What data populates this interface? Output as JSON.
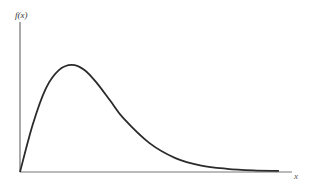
{
  "chart_data": {
    "type": "line",
    "title": "",
    "xlabel": "x",
    "ylabel": "f(x)",
    "grid": false,
    "legend": null,
    "series": [
      {
        "name": "f(x)",
        "x": [
          0,
          0.5,
          1,
          1.5,
          2,
          2.5,
          3,
          3.5,
          4,
          5,
          6,
          7,
          8,
          9,
          10
        ],
        "y": [
          0,
          0.45,
          0.78,
          0.95,
          1.0,
          0.95,
          0.82,
          0.66,
          0.5,
          0.27,
          0.13,
          0.06,
          0.03,
          0.015,
          0.01
        ]
      }
    ],
    "xlim": [
      0,
      10.5
    ],
    "ylim": [
      0,
      1.4
    ],
    "ticks": {
      "x": [],
      "y": []
    }
  },
  "labels": {
    "y_axis": "f(x)",
    "x_axis": "x"
  },
  "colors": {
    "curve": "#2b2b2b",
    "axis": "#555555"
  }
}
